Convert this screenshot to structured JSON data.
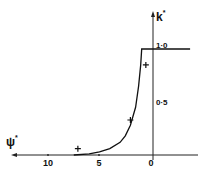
{
  "chart_data": {
    "type": "line",
    "title": "",
    "xlabel": "ψ*",
    "ylabel": "k*",
    "x_axis_reversed": true,
    "xlim": [
      13,
      -4
    ],
    "ylim": [
      0,
      1.05
    ],
    "x_ticks": [
      "10",
      "5",
      "0"
    ],
    "y_ticks": [
      "0·5",
      "1·0"
    ],
    "grid": false,
    "legend": null,
    "series": [
      {
        "name": "theory curve",
        "style": "line",
        "x": [
          7.5,
          6.0,
          5.0,
          4.0,
          3.0,
          2.5,
          2.0,
          1.5,
          1.2,
          1.0,
          0.9,
          0.9,
          -3.8
        ],
        "y": [
          0.0,
          0.01,
          0.03,
          0.06,
          0.12,
          0.18,
          0.28,
          0.45,
          0.65,
          0.85,
          1.0,
          1.0,
          1.0
        ]
      },
      {
        "name": "data points",
        "style": "markers",
        "marker": "+",
        "x": [
          7.1,
          2.0,
          0.5
        ],
        "y": [
          0.06,
          0.33,
          0.85
        ]
      }
    ]
  },
  "labels": {
    "x_axis_symbol": "ψ",
    "x_axis_sup": "*",
    "y_axis_symbol": "k",
    "y_axis_sup": "*",
    "x_tick_10": "10",
    "x_tick_5": "5",
    "x_tick_0": "0",
    "y_tick_05": "0·5",
    "y_tick_10": "1·0"
  }
}
